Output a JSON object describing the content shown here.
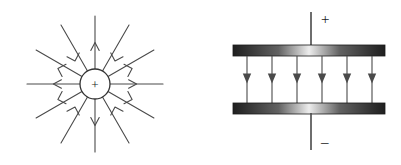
{
  "figure": {
    "background_color": "#ffffff",
    "line_color": "#4a4a4a",
    "ink_color": "#1a1a1a",
    "width": 401,
    "height": 165
  },
  "panels": [
    {
      "id": "point-charge-field",
      "name": "radial-field-of-point-charge",
      "charge": {
        "sign_label": "+",
        "polarity": "positive",
        "center_x": 95,
        "center_y": 84,
        "radius": 15
      },
      "field": {
        "direction": "outward",
        "ray_count": 12,
        "ray_length": 68,
        "angles_deg": [
          0,
          30,
          60,
          90,
          120,
          150,
          180,
          210,
          240,
          270,
          300,
          330
        ],
        "arrowhead_position_fraction": 0.52,
        "arrowhead_style": "open-v"
      }
    },
    {
      "id": "parallel-plate-field",
      "name": "uniform-field-between-parallel-plates",
      "plates": [
        {
          "id": "top-plate",
          "label": "+",
          "polarity": "positive",
          "x": 233,
          "y": 45,
          "width": 152,
          "height": 11,
          "gradient_edge_color": "#2b2b2b",
          "gradient_center_color": "#e8e8e8"
        },
        {
          "id": "bottom-plate",
          "label": "–",
          "polarity": "negative",
          "x": 233,
          "y": 103,
          "width": 152,
          "height": 11,
          "gradient_edge_color": "#2b2b2b",
          "gradient_center_color": "#e8e8e8"
        }
      ],
      "leads": [
        {
          "id": "top-lead",
          "x": 311,
          "y_start": 12,
          "y_end": 45,
          "label": "+",
          "label_x": 321,
          "label_y": 23
        },
        {
          "id": "bottom-lead",
          "x": 311,
          "y_start": 114,
          "y_end": 150,
          "label": "–",
          "label_x": 321,
          "label_y": 144
        }
      ],
      "field": {
        "direction": "downward",
        "line_count": 6,
        "line_x_positions": [
          247,
          272,
          297,
          322,
          347,
          372
        ],
        "y_start": 56,
        "y_end": 103,
        "arrowhead_y": 79,
        "arrowhead_style": "filled-triangle"
      }
    }
  ]
}
